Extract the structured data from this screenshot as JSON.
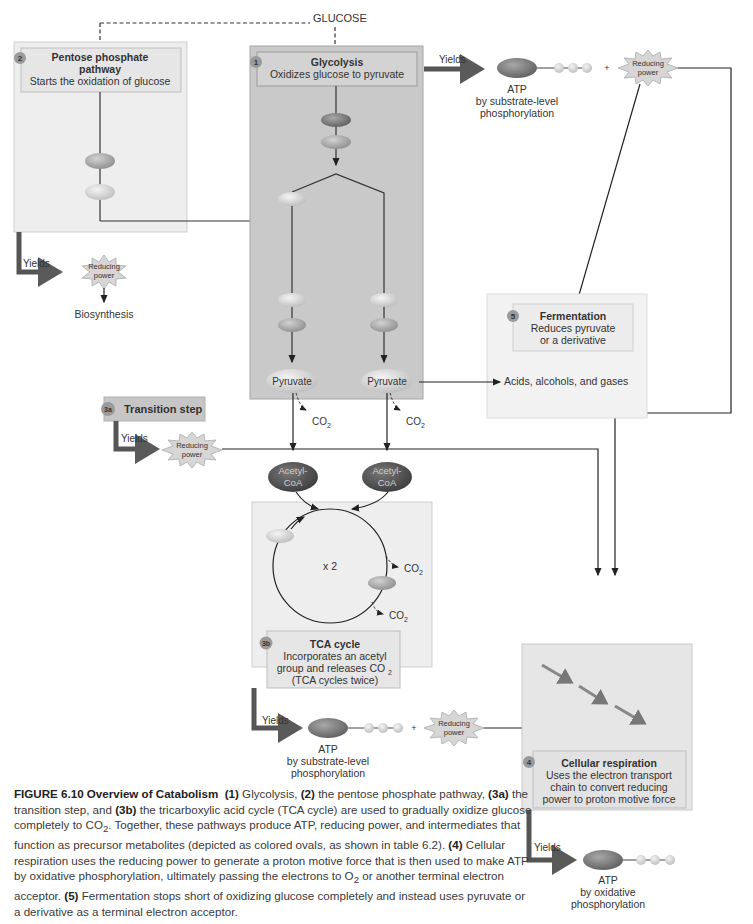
{
  "source_label": "GLUCOSE",
  "glycolysis": {
    "number": "1",
    "title": "Glycolysis",
    "subtitle": "Oxidizes glucose to pyruvate",
    "pyruvate_left": "Pyruvate",
    "pyruvate_right": "Pyruvate"
  },
  "pentose": {
    "number": "2",
    "title_line1": "Pentose phosphate",
    "title_line2": "pathway",
    "subtitle": "Starts the oxidation of glucose",
    "yields": "Yields",
    "reducing_l1": "Reducing",
    "reducing_l2": "power",
    "output": "Biosynthesis"
  },
  "glycolysis_yield": {
    "yields": "Yields",
    "atp": "ATP",
    "desc_l1": "by substrate-level",
    "desc_l2": "phosphorylation",
    "plus": "+",
    "reducing_l1": "Reducing",
    "reducing_l2": "power"
  },
  "transition": {
    "number": "3a",
    "title": "Transition step",
    "yields": "Yields",
    "reducing_l1": "Reducing",
    "reducing_l2": "power",
    "co2": "CO",
    "co2_sub": "2"
  },
  "acetyl": {
    "l1": "Acetyl-",
    "l2": "CoA"
  },
  "tca": {
    "number": "3b",
    "title": "TCA cycle",
    "line1": "Incorporates an acetyl",
    "line2": "group and releases CO",
    "line2_sub": "2",
    "line3": "(TCA cycles twice)",
    "multiplier": "x 2",
    "co2": "CO",
    "co2_sub": "2"
  },
  "tca_yield": {
    "yields": "Yields",
    "atp": "ATP",
    "desc_l1": "by substrate-level",
    "desc_l2": "phosphorylation",
    "plus": "+",
    "reducing_l1": "Reducing",
    "reducing_l2": "power"
  },
  "fermentation": {
    "number": "5",
    "title": "Fermentation",
    "line1": "Reduces pyruvate",
    "line2": "or a derivative",
    "products": "Acids, alcohols, and gases"
  },
  "respiration": {
    "number": "4",
    "title": "Cellular respiration",
    "line1": "Uses the electron transport",
    "line2": "chain to convert reducing",
    "line3": "power to proton motive force",
    "yields": "Yields",
    "atp": "ATP",
    "desc_l1": "by oxidative",
    "desc_l2": "phosphorylation"
  },
  "caption": {
    "figure_label": "FIGURE 6.10",
    "figure_title": "Overview of Catabolism",
    "p1": "(1)",
    "t1": " Glycolysis, ",
    "p2": "(2)",
    "t2": " the pentose phosphate pathway, ",
    "p3a": "(3a)",
    "t3a": " the transition step, and ",
    "p3b": "(3b)",
    "t3b": " the tricarboxylic acid cycle (TCA cycle) are used to gradually oxidize glucose completely to CO",
    "co2_sub": "2",
    "t3c": ". Together, these pathways produce ATP, reducing power, and intermediates that function as precursor metabolites (depicted as colored ovals, as shown in table 6.2). ",
    "p4": "(4)",
    "t4": " Cellular respiration uses the reducing power to generate a proton motive force that is then used to make ATP by oxidative phosphorylation, ultimately passing the electrons to O",
    "o2_sub": "2",
    "t4b": " or another terminal electron acceptor. ",
    "p5": "(5)",
    "t5": " Fermentation stops short of oxidizing glucose completely and instead uses pyruvate or a derivative as a terminal electron acceptor."
  },
  "colors": {
    "dark_box": "#c9c9c9",
    "light_box": "#eeeeee",
    "badge": "#9a9a9a",
    "arrow": "#555555",
    "star": "#d6d6d6"
  }
}
